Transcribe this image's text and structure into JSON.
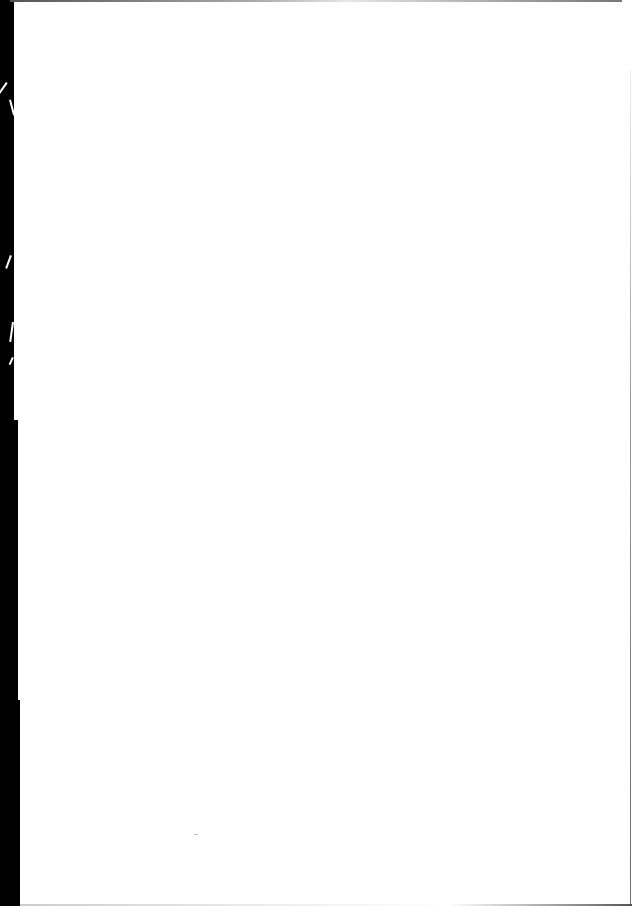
{
  "page": {
    "type": "scanned-blank-page",
    "content_text": "",
    "colors": {
      "paper": "#ffffff",
      "scan_border": "#000000"
    }
  }
}
